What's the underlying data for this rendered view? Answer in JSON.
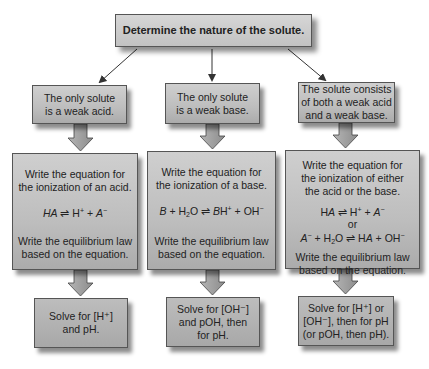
{
  "header": {
    "text": "Determine the nature of the solute."
  },
  "columns": [
    {
      "case": {
        "lines": [
          "The only solute",
          "is a weak acid."
        ]
      },
      "steps": {
        "line1": "Write the equation for",
        "line2": "the ionization of an acid.",
        "equation": {
          "left_species": "HA",
          "arrow": "⇌",
          "right": "H⁺ + A⁻"
        },
        "law_line1": "Write the equilibrium law",
        "law_line2": "based on the equation."
      },
      "solve": {
        "lines": [
          "Solve for [H⁺]",
          "and pH."
        ]
      }
    },
    {
      "case": {
        "lines": [
          "The only solute",
          "is a weak base."
        ]
      },
      "steps": {
        "line1": "Write the equation for",
        "line2": "the ionization of a base.",
        "equation": {
          "left": "B + H₂O",
          "arrow": "⇌",
          "right": "BH⁺ + OH⁻"
        },
        "law_line1": "Write the equilibrium law",
        "law_line2": "based on the equation."
      },
      "solve": {
        "lines": [
          "Solve for [OH⁻]",
          "and pOH, then",
          "for pH."
        ]
      }
    },
    {
      "case": {
        "lines": [
          "The solute consists",
          "of both a weak acid",
          "and a weak base."
        ]
      },
      "steps": {
        "line1": "Write the equation for",
        "line2": "the ionization of either",
        "line3": "the acid or the base.",
        "equation1": {
          "left": "HA",
          "arrow": "⇌",
          "right": "H⁺ + A⁻"
        },
        "or_label": "or",
        "equation2": {
          "left": "A⁻ + H₂O",
          "arrow": "⇌",
          "right": "HA + OH⁻"
        },
        "law_line1": "Write the equilibrium law",
        "law_line2": "based on the equation."
      },
      "solve": {
        "lines": [
          "Solve for [H⁺] or",
          "[OH⁻], then for pH",
          "(or pOH, then pH)."
        ]
      }
    }
  ],
  "colors": {
    "box_fill": "#bdbdbd",
    "box_border": "#555555",
    "arrow_fill": "#9a9a9a",
    "connector_line": "#333333"
  }
}
